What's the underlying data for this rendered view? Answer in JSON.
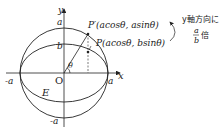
{
  "diagram": {
    "axes": {
      "x_label": "x",
      "y_label": "y",
      "origin_label": "O"
    },
    "circle": {
      "top_label": "a",
      "bottom_label": "-a",
      "left_label": "-a",
      "right_label": "a"
    },
    "ellipse": {
      "name": "E",
      "top_label": "b"
    },
    "angle_label": "θ",
    "point_p_prime": "P′(acosθ, asinθ)",
    "point_p": "P(acosθ, bsinθ)",
    "annotation_line1": "y軸方向に",
    "annotation_frac_num": "a",
    "annotation_frac_den": "b",
    "annotation_suffix": "倍",
    "colors": {
      "stroke": "#222222",
      "background": "#ffffff"
    }
  }
}
